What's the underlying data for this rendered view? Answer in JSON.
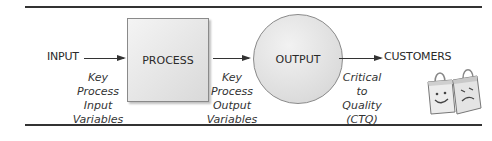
{
  "diagram": {
    "nodes": {
      "input": "INPUT",
      "process": "PROCESS",
      "output": "OUTPUT",
      "customers": "CUSTOMERS"
    },
    "notes": {
      "kpiv": [
        "Key",
        "Process",
        "Input",
        "Variables"
      ],
      "kpov": [
        "Key",
        "Process",
        "Output",
        "Variables"
      ],
      "ctq": [
        "Critical",
        "to",
        "Quality",
        "(CTQ)"
      ]
    },
    "icons": {
      "customers": "shopping-bags-happy-sad-icon"
    },
    "colors": {
      "line": "#333333",
      "shape_fill": "#dcdcdc",
      "shape_border": "#8a8a8a"
    }
  }
}
